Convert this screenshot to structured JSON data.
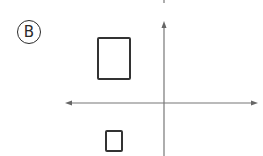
{
  "figure": {
    "option_label": "B",
    "colors": {
      "stroke": "#333333",
      "axis": "#6e6e6e",
      "background": "#ffffff"
    }
  },
  "shapes": [
    {
      "name": "large-rectangle",
      "quadrant": "II",
      "x": 97,
      "y": 37,
      "width": 34,
      "height": 43
    },
    {
      "name": "small-rectangle",
      "quadrant": "III",
      "x": 105,
      "y": 130,
      "width": 18,
      "height": 22
    }
  ],
  "axes": {
    "x_axis": {
      "y": 103,
      "x_start": 66,
      "x_end": 257,
      "arrows": "both"
    },
    "y_axis": {
      "x": 164,
      "y_start": 22,
      "y_end": 156,
      "arrows": "top"
    }
  }
}
